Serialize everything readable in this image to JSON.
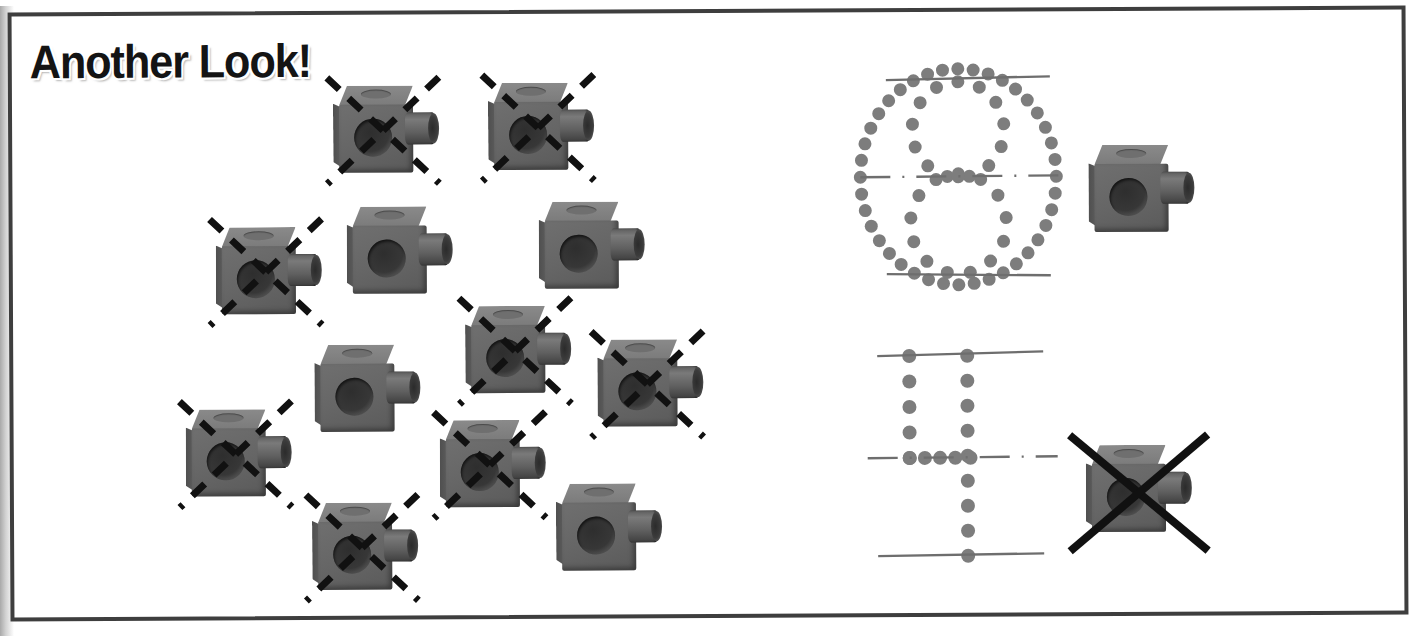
{
  "page": {
    "title": "Another Look!",
    "width": 1425,
    "height": 641,
    "background": "#ffffff",
    "border_color": "#3e3e3e"
  },
  "colors": {
    "cube_front": "#666666",
    "cube_top": "#7f7f7f",
    "cube_hole": "#343434",
    "cube_peg": "#5d5d5d",
    "dot_gray": "#7d7d7d",
    "rule_gray": "#6e6e6e",
    "mark_black": "#111111",
    "title_fill": "#141414",
    "title_outline": "#ffffff"
  },
  "icons": {
    "cube": "snap-cube-icon",
    "cross_out_dashed": "dashed-x-icon",
    "cross_out_solid": "solid-x-icon",
    "dotted_eight": "dotted-figure-eight-icon",
    "dotted_four": "dotted-figure-four-icon"
  },
  "cube_cluster": {
    "label": "snap cube counting cluster",
    "total_cubes": 13,
    "crossed_out": 9,
    "remaining": 4,
    "cubes": [
      {
        "id": "cube-1",
        "x": 325,
        "y": 75,
        "crossed": true,
        "mark": "dashed"
      },
      {
        "id": "cube-2",
        "x": 480,
        "y": 73,
        "crossed": true,
        "mark": "dashed"
      },
      {
        "id": "cube-3",
        "x": 207,
        "y": 216,
        "crossed": true,
        "mark": "dashed"
      },
      {
        "id": "cube-4",
        "x": 338,
        "y": 196,
        "crossed": false,
        "mark": "none"
      },
      {
        "id": "cube-5",
        "x": 530,
        "y": 192,
        "crossed": false,
        "mark": "none"
      },
      {
        "id": "cube-6",
        "x": 305,
        "y": 334,
        "crossed": false,
        "mark": "none"
      },
      {
        "id": "cube-7",
        "x": 456,
        "y": 296,
        "crossed": true,
        "mark": "dashed"
      },
      {
        "id": "cube-8",
        "x": 588,
        "y": 330,
        "crossed": true,
        "mark": "dashed"
      },
      {
        "id": "cube-9",
        "x": 176,
        "y": 398,
        "crossed": true,
        "mark": "dashed"
      },
      {
        "id": "cube-10",
        "x": 430,
        "y": 410,
        "crossed": true,
        "mark": "dashed"
      },
      {
        "id": "cube-11",
        "x": 546,
        "y": 474,
        "crossed": false,
        "mark": "none"
      },
      {
        "id": "cube-12",
        "x": 302,
        "y": 492,
        "crossed": true,
        "mark": "dashed"
      }
    ]
  },
  "right_panel": {
    "top_figure": {
      "id": "dotted-eight",
      "name": "dotted figure eight on ruled lines",
      "digit": "8",
      "dot_color": "#7d7d7d",
      "rules": [
        "top-line",
        "center-dash-line",
        "bottom-line"
      ]
    },
    "top_cube": {
      "id": "cube-model-top",
      "crossed": false,
      "x": 1092,
      "y": 148
    },
    "bottom_figure": {
      "id": "dotted-four",
      "name": "dotted figure four on ruled lines",
      "digit": "4",
      "dot_color": "#7d7d7d",
      "rules": [
        "top-line",
        "center-dash-line",
        "bottom-line"
      ]
    },
    "bottom_cube": {
      "id": "cube-model-bottom",
      "crossed": true,
      "mark": "solid",
      "x": 1088,
      "y": 446
    }
  }
}
